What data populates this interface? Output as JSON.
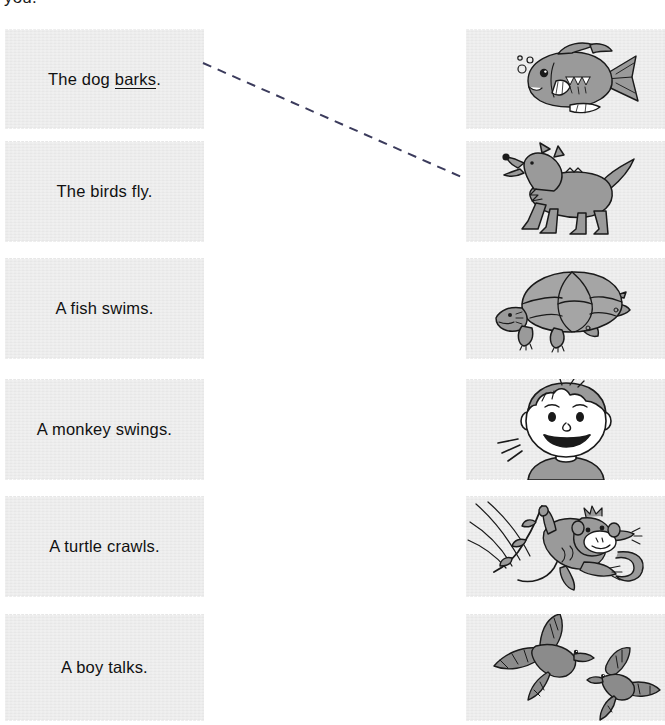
{
  "page": {
    "instruction_fragment": "you.",
    "background_color": "#ffffff",
    "card_color": "#e7e7e7",
    "ink_color": "#111111",
    "art_fill_color": "#8f8f8f",
    "art_line_color": "#1a1a1a",
    "match_line_color": "#3b3b5c"
  },
  "sentences": [
    {
      "id": "sentence-dog",
      "text": "The dog barks.",
      "before": "The dog ",
      "underlined": "barks",
      "after": ".",
      "has_underline": true
    },
    {
      "id": "sentence-birds",
      "text": "The birds fly.",
      "before": "The birds fly.",
      "underlined": "",
      "after": "",
      "has_underline": false
    },
    {
      "id": "sentence-fish",
      "text": "A fish swims.",
      "before": "A fish swims.",
      "underlined": "",
      "after": "",
      "has_underline": false
    },
    {
      "id": "sentence-monkey",
      "text": "A monkey swings.",
      "before": "A monkey swings.",
      "underlined": "",
      "after": "",
      "has_underline": false
    },
    {
      "id": "sentence-turtle",
      "text": "A turtle crawls.",
      "before": "A turtle crawls.",
      "underlined": "",
      "after": "",
      "has_underline": false
    },
    {
      "id": "sentence-boy",
      "text": "A boy talks.",
      "before": "A boy talks.",
      "underlined": "",
      "after": "",
      "has_underline": false
    }
  ],
  "pictures": [
    {
      "id": "picture-fish",
      "subject": "fish",
      "label": "fish-illustration"
    },
    {
      "id": "picture-dog",
      "subject": "dog",
      "label": "dog-illustration"
    },
    {
      "id": "picture-turtle",
      "subject": "turtle",
      "label": "turtle-illustration"
    },
    {
      "id": "picture-boy",
      "subject": "boy",
      "label": "boy-illustration"
    },
    {
      "id": "picture-monkey",
      "subject": "monkey",
      "label": "monkey-illustration"
    },
    {
      "id": "picture-birds",
      "subject": "birds",
      "label": "birds-illustration"
    }
  ],
  "connections": [
    {
      "id": "connection-dog",
      "from": "sentence-dog",
      "to": "picture-dog",
      "x1": 203,
      "y1": 63,
      "x2": 466,
      "y2": 179,
      "style": "dashed"
    }
  ]
}
